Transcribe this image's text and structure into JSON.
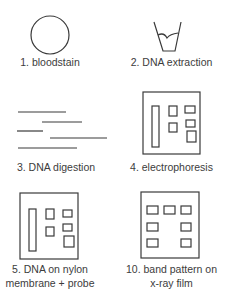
{
  "diagram": {
    "steps": [
      {
        "number": "1",
        "label": "1. bloodstain",
        "icon": "bloodstain-circle"
      },
      {
        "number": "2",
        "label": "2. DNA extraction",
        "icon": "test-tube"
      },
      {
        "number": "3",
        "label": "3. DNA digestion",
        "icon": "dna-fragments"
      },
      {
        "number": "4",
        "label": "4. electrophoresis",
        "icon": "gel"
      },
      {
        "number": "5",
        "label_lines": [
          "5. DNA on nylon",
          "membrane + probe"
        ],
        "icon": "nylon-membrane"
      },
      {
        "number": "10",
        "label_lines": [
          "10. band pattern on",
          "x-ray film"
        ],
        "icon": "x-ray-film"
      }
    ]
  },
  "colors": {
    "stroke": "#3a3a3a",
    "text": "#3c3c3c",
    "background": "#ffffff"
  }
}
